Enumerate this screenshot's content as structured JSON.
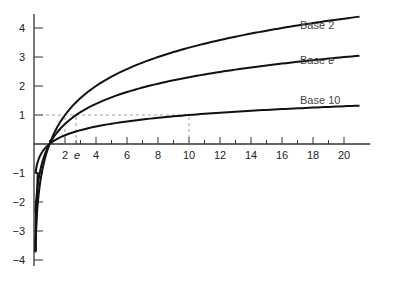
{
  "chart_data": {
    "type": "line",
    "title": "",
    "xlabel": "",
    "ylabel": "",
    "xlim": [
      0,
      21
    ],
    "ylim": [
      -4.3,
      4.5
    ],
    "grid": false,
    "legend_position": "inline labels at right end of curves",
    "x_ticks": [
      2,
      4,
      6,
      8,
      10,
      12,
      14,
      16,
      18,
      20
    ],
    "x_tick_labels": [
      "2",
      "e",
      "4",
      "6",
      "8",
      "10",
      "12",
      "14",
      "16",
      "18",
      "20"
    ],
    "y_ticks": [
      -4,
      -3,
      -2,
      -1,
      1,
      2,
      3,
      4
    ],
    "y_tick_labels": [
      "4",
      "3",
      "2",
      "1",
      "−1",
      "−2",
      "−3",
      "−4"
    ],
    "series": [
      {
        "name": "Base 2",
        "function": "log2(x)",
        "x": [
          0.07,
          0.5,
          1,
          2,
          2.718,
          4,
          8,
          10,
          16,
          20,
          21
        ],
        "values": [
          -3.8,
          -1,
          0,
          1,
          1.44,
          2,
          3,
          3.32,
          4,
          4.32,
          4.39
        ]
      },
      {
        "name": "Base e",
        "function": "ln(x)",
        "x": [
          0.025,
          0.5,
          1,
          2,
          2.718,
          4,
          8,
          10,
          16,
          20,
          21
        ],
        "values": [
          -3.7,
          -0.69,
          0,
          0.69,
          1,
          1.39,
          2.08,
          2.3,
          2.77,
          3.0,
          3.04
        ]
      },
      {
        "name": "Base 10",
        "function": "log10(x)",
        "x": [
          0.0002,
          0.1,
          0.5,
          1,
          2,
          2.718,
          4,
          8,
          10,
          16,
          20,
          21
        ],
        "values": [
          -3.7,
          -1,
          -0.3,
          0,
          0.3,
          0.43,
          0.6,
          0.9,
          1,
          1.2,
          1.3,
          1.32
        ]
      }
    ],
    "annotations": [
      {
        "type": "dashed-line",
        "description": "horizontal y=1 from axis to x=10"
      },
      {
        "type": "dashed-line",
        "description": "vertical x=e from 0 to y=1"
      },
      {
        "type": "dashed-line",
        "description": "vertical x=2 from 0 to y=1"
      },
      {
        "type": "dashed-line",
        "description": "vertical x=10 from 0 to y=1"
      }
    ]
  },
  "labels": {
    "base2": "Base 2",
    "basee_prefix": "Base ",
    "basee_var": "e",
    "base10": "Base 10",
    "e_tick": "e"
  }
}
